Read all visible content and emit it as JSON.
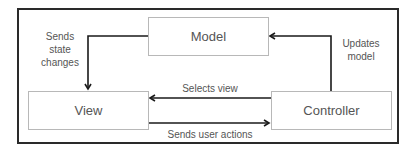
{
  "diagram": {
    "nodes": {
      "model": "Model",
      "view": "View",
      "controller": "Controller"
    },
    "edges": {
      "model_to_view": [
        "Sends",
        "state",
        "changes"
      ],
      "controller_to_model": [
        "Updates",
        "model"
      ],
      "controller_to_view": "Selects view",
      "view_to_controller": "Sends user actions"
    },
    "colors": {
      "frame": "#2a2a2a",
      "box_border": "#b8b8b8",
      "arrow": "#1a1a1a",
      "text": "#555555"
    }
  }
}
